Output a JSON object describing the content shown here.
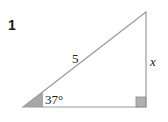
{
  "problem": {
    "number": "1"
  },
  "triangle": {
    "hypotenuse_label": "5",
    "opposite_label": "x",
    "angle_label": "37°",
    "right_angle": true,
    "angle_fill": "#a8a8a8",
    "line_color": "#9a9a9a"
  }
}
